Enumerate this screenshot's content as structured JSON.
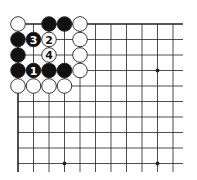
{
  "diagram": {
    "type": "go-board-fragment",
    "corner": "top-left",
    "grid": {
      "origin_x": 18,
      "origin_y": 24,
      "spacing": 15.5,
      "cols": 11,
      "rows": 10,
      "right_edge_x": 183,
      "bottom_edge_y": 172
    },
    "star_points": [
      [
        9,
        3
      ],
      [
        3,
        9
      ],
      [
        9,
        9
      ]
    ],
    "stones": [
      {
        "col": 0,
        "row": 0,
        "color": "white",
        "label": ""
      },
      {
        "col": 2,
        "row": 0,
        "color": "black",
        "label": ""
      },
      {
        "col": 3,
        "row": 0,
        "color": "black",
        "label": ""
      },
      {
        "col": 4,
        "row": 0,
        "color": "white",
        "label": ""
      },
      {
        "col": 0,
        "row": 1,
        "color": "black",
        "label": ""
      },
      {
        "col": 1,
        "row": 1,
        "color": "black",
        "label": "3"
      },
      {
        "col": 2,
        "row": 1,
        "color": "white",
        "label": "2"
      },
      {
        "col": 4,
        "row": 1,
        "color": "white",
        "label": ""
      },
      {
        "col": 0,
        "row": 2,
        "color": "black",
        "label": ""
      },
      {
        "col": 2,
        "row": 2,
        "color": "white",
        "label": "4"
      },
      {
        "col": 4,
        "row": 2,
        "color": "white",
        "label": ""
      },
      {
        "col": 0,
        "row": 3,
        "color": "black",
        "label": ""
      },
      {
        "col": 1,
        "row": 3,
        "color": "black",
        "label": "1"
      },
      {
        "col": 2,
        "row": 3,
        "color": "black",
        "label": ""
      },
      {
        "col": 3,
        "row": 3,
        "color": "black",
        "label": ""
      },
      {
        "col": 4,
        "row": 3,
        "color": "white",
        "label": ""
      },
      {
        "col": 0,
        "row": 4,
        "color": "white",
        "label": ""
      },
      {
        "col": 1,
        "row": 4,
        "color": "white",
        "label": ""
      },
      {
        "col": 2,
        "row": 4,
        "color": "white",
        "label": ""
      },
      {
        "col": 3,
        "row": 4,
        "color": "white",
        "label": ""
      }
    ],
    "colors": {
      "line": "#222222",
      "black_stone": "#111111",
      "white_stone": "#ffffff",
      "stone_outline": "#222222"
    }
  }
}
